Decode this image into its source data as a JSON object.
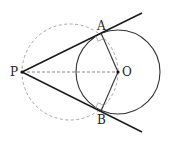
{
  "diagram": {
    "labels": {
      "P": "P",
      "O": "O",
      "A": "A",
      "B": "B"
    },
    "points": {
      "P": [
        22,
        72
      ],
      "O": [
        118,
        72
      ],
      "A": [
        101,
        33
      ],
      "B": [
        101,
        111
      ]
    },
    "circles": {
      "solid": {
        "center": "O",
        "radius": 42
      },
      "dashed": {
        "center": [
          70,
          72
        ],
        "radius": 48
      }
    },
    "segments": [
      "PA (tangent, extended)",
      "PB (tangent, extended)",
      "OA",
      "OB",
      "PO (dashed)"
    ],
    "right_angle_marks": [
      "A",
      "B"
    ],
    "colors": {
      "line": "#1a1a1a",
      "dashed": "#999999"
    }
  }
}
